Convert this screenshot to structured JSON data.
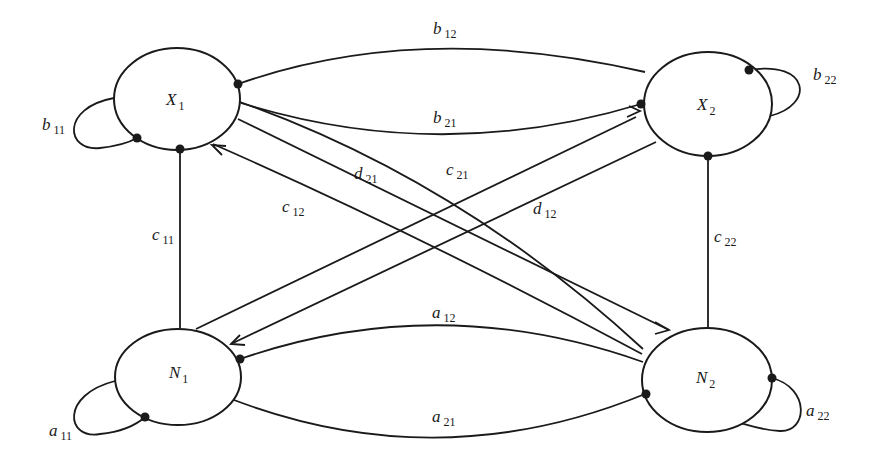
{
  "diagram": {
    "type": "interaction-graph",
    "nodes": [
      {
        "id": "X1",
        "letter": "X",
        "sub": "1"
      },
      {
        "id": "X2",
        "letter": "X",
        "sub": "2"
      },
      {
        "id": "N1",
        "letter": "N",
        "sub": "1"
      },
      {
        "id": "N2",
        "letter": "N",
        "sub": "2"
      }
    ],
    "edges": {
      "b11": {
        "letter": "b",
        "sub": "11",
        "from": "X1",
        "to": "X1",
        "kind": "self-loop"
      },
      "b22": {
        "letter": "b",
        "sub": "22",
        "from": "X2",
        "to": "X2",
        "kind": "self-loop"
      },
      "a11": {
        "letter": "a",
        "sub": "11",
        "from": "N1",
        "to": "N1",
        "kind": "self-loop"
      },
      "a22": {
        "letter": "a",
        "sub": "22",
        "from": "N2",
        "to": "N2",
        "kind": "self-loop"
      },
      "b12": {
        "letter": "b",
        "sub": "12",
        "from": "X2",
        "to": "X1"
      },
      "b21": {
        "letter": "b",
        "sub": "21",
        "from": "X1",
        "to": "X2"
      },
      "a12": {
        "letter": "a",
        "sub": "12",
        "from": "N2",
        "to": "N1"
      },
      "a21": {
        "letter": "a",
        "sub": "21",
        "from": "N1",
        "to": "N2"
      },
      "c11": {
        "letter": "c",
        "sub": "11",
        "from": "N1",
        "to": "X1"
      },
      "c22": {
        "letter": "c",
        "sub": "22",
        "from": "N2",
        "to": "X2"
      },
      "c12": {
        "letter": "c",
        "sub": "12",
        "from": "N2",
        "to": "X1"
      },
      "c21": {
        "letter": "c",
        "sub": "21",
        "from": "N1",
        "to": "X2"
      },
      "d12": {
        "letter": "d",
        "sub": "12",
        "from": "X2",
        "to": "N1"
      },
      "d21": {
        "letter": "d",
        "sub": "21",
        "from": "X1",
        "to": "N2"
      }
    },
    "colors": {
      "stroke": "#1a1a1a",
      "background": "#ffffff"
    }
  }
}
